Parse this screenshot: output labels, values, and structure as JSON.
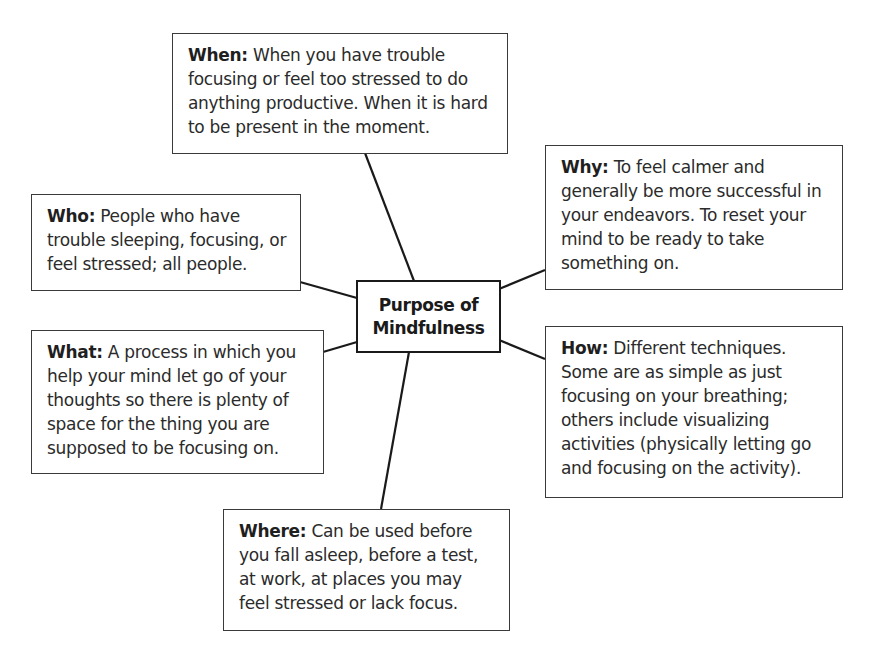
{
  "diagram": {
    "type": "mind-map",
    "center": {
      "line1": "Purpose of",
      "line2": "Mindfulness"
    },
    "nodes": {
      "when": {
        "label": "When:",
        "text": " When you have trouble focusing or feel too stressed to do anything productive. When it is hard to be present in the moment."
      },
      "why": {
        "label": "Why:",
        "text": " To feel calmer and generally be more successful in your endeavors. To reset your mind to be ready to take something on."
      },
      "who": {
        "label": "Who:",
        "text": " People who have trouble sleeping, focusing, or feel stressed; all people."
      },
      "what": {
        "label": "What:",
        "text": " A process in which you help your mind let go of your thoughts so there is plenty of space for the thing you are supposed to be focusing on."
      },
      "how": {
        "label": "How:",
        "text": " Different techniques. Some are as simple as just focusing on your breathing; others include visualizing activities (physically letting go and focusing on the activity)."
      },
      "where": {
        "label": "Where:",
        "text": " Can be used before you fall asleep, before a test, at work, at places you may feel stressed or lack focus."
      }
    },
    "colors": {
      "line": "#1a1a1a",
      "border": "#3a3a3a",
      "text": "#2b2b2b",
      "background": "#ffffff"
    }
  }
}
